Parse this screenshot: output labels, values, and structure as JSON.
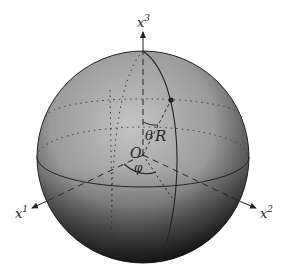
{
  "figure": {
    "type": "spherical-coordinates-diagram",
    "axes": {
      "x1": {
        "label": "x",
        "sup": "1"
      },
      "x2": {
        "label": "x",
        "sup": "2"
      },
      "x3": {
        "label": "x",
        "sup": "3"
      }
    },
    "origin_label": "O",
    "radius_label": "R",
    "polar_angle_label": "θ",
    "azimuth_angle_label": "φ",
    "colors": {
      "sphere_light": "#b8b8b8",
      "sphere_dark": "#1a1a1a",
      "line": "#222222",
      "background": "#ffffff"
    }
  }
}
